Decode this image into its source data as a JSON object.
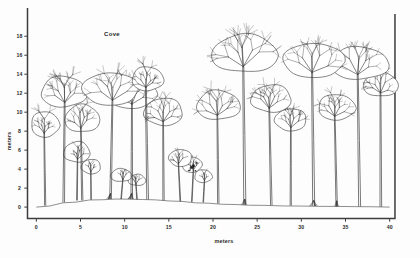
{
  "chart_data": {
    "type": "diagram-profile",
    "title": "Cove",
    "xlabel": "meters",
    "ylabel": "meters",
    "xlim": [
      -1,
      41
    ],
    "ylim": [
      -1.2,
      19.5
    ],
    "xticks": [
      0,
      5,
      10,
      15,
      20,
      25,
      30,
      35,
      40
    ],
    "xtick_labels": [
      "0",
      "5",
      "10",
      "15",
      "20",
      "25",
      "30",
      "35",
      "40"
    ],
    "yticks": [
      0,
      2,
      4,
      6,
      8,
      10,
      12,
      14,
      16,
      18
    ],
    "ytick_labels": [
      "0",
      "2",
      "4",
      "6",
      "8",
      "10",
      "12",
      "14",
      "16",
      "18"
    ],
    "grid": false,
    "legend": false,
    "frame_sides": [
      "left",
      "bottom",
      "right"
    ],
    "line_color": "#3a3a3a",
    "ground_color": "#6a6a6a",
    "ground_profile": [
      [
        0,
        0.0
      ],
      [
        3,
        0.45
      ],
      [
        6,
        0.75
      ],
      [
        9,
        0.85
      ],
      [
        12,
        0.8
      ],
      [
        15,
        0.65
      ],
      [
        18,
        0.45
      ],
      [
        21,
        0.3
      ],
      [
        24,
        0.2
      ],
      [
        28,
        0.12
      ],
      [
        32,
        0.08
      ],
      [
        36,
        0.05
      ],
      [
        40,
        0.0
      ]
    ],
    "trees": [
      {
        "id": 1,
        "x": 1.0,
        "base": 0.15,
        "height": 10.2,
        "crown_w": 3.2,
        "crown_h": 3.0,
        "crown_y": 8.6,
        "dark": false,
        "buttress": false
      },
      {
        "id": 2,
        "x": 3.1,
        "base": 0.5,
        "height": 14.0,
        "crown_w": 5.2,
        "crown_h": 3.6,
        "crown_y": 12.0,
        "dark": false,
        "buttress": false
      },
      {
        "id": 3,
        "x": 5.2,
        "base": 0.7,
        "height": 11.0,
        "crown_w": 4.0,
        "crown_h": 3.2,
        "crown_y": 9.2,
        "dark": false,
        "buttress": false
      },
      {
        "id": 4,
        "x": 4.6,
        "base": 0.7,
        "height": 7.0,
        "crown_w": 3.0,
        "crown_h": 2.4,
        "crown_y": 5.7,
        "dark": false,
        "buttress": false
      },
      {
        "id": 5,
        "x": 6.2,
        "base": 0.78,
        "height": 5.1,
        "crown_w": 2.2,
        "crown_h": 1.7,
        "crown_y": 4.2,
        "dark": false,
        "buttress": false
      },
      {
        "id": 6,
        "x": 8.4,
        "base": 0.85,
        "height": 14.2,
        "crown_w": 6.4,
        "crown_h": 3.8,
        "crown_y": 12.3,
        "dark": false,
        "buttress": true
      },
      {
        "id": 7,
        "x": 10.8,
        "base": 0.85,
        "height": 13.6,
        "crown_w": 5.6,
        "crown_h": 3.4,
        "crown_y": 11.8,
        "dark": false,
        "buttress": true
      },
      {
        "id": 8,
        "x": 12.6,
        "base": 0.8,
        "height": 15.0,
        "crown_w": 3.6,
        "crown_h": 2.8,
        "crown_y": 13.4,
        "dark": false,
        "buttress": false
      },
      {
        "id": 9,
        "x": 9.6,
        "base": 0.85,
        "height": 4.0,
        "crown_w": 2.4,
        "crown_h": 1.5,
        "crown_y": 3.3,
        "dark": false,
        "buttress": false
      },
      {
        "id": 10,
        "x": 11.4,
        "base": 0.82,
        "height": 3.4,
        "crown_w": 2.0,
        "crown_h": 1.3,
        "crown_y": 2.8,
        "dark": false,
        "buttress": false
      },
      {
        "id": 11,
        "x": 14.4,
        "base": 0.7,
        "height": 11.6,
        "crown_w": 4.4,
        "crown_h": 3.2,
        "crown_y": 9.9,
        "dark": false,
        "buttress": false
      },
      {
        "id": 12,
        "x": 16.3,
        "base": 0.6,
        "height": 6.2,
        "crown_w": 2.6,
        "crown_h": 2.0,
        "crown_y": 5.1,
        "dark": false,
        "buttress": false
      },
      {
        "id": 13,
        "x": 17.6,
        "base": 0.55,
        "height": 5.4,
        "crown_w": 2.3,
        "crown_h": 1.8,
        "crown_y": 4.4,
        "dark": true,
        "buttress": false
      },
      {
        "id": 14,
        "x": 18.9,
        "base": 0.5,
        "height": 4.0,
        "crown_w": 2.0,
        "crown_h": 1.5,
        "crown_y": 3.2,
        "dark": false,
        "buttress": false
      },
      {
        "id": 15,
        "x": 20.6,
        "base": 0.38,
        "height": 12.4,
        "crown_w": 5.0,
        "crown_h": 3.4,
        "crown_y": 10.6,
        "dark": false,
        "buttress": false
      },
      {
        "id": 16,
        "x": 23.6,
        "base": 0.25,
        "height": 18.3,
        "crown_w": 7.6,
        "crown_h": 4.4,
        "crown_y": 16.0,
        "dark": false,
        "buttress": true
      },
      {
        "id": 17,
        "x": 26.6,
        "base": 0.2,
        "height": 13.0,
        "crown_w": 4.6,
        "crown_h": 3.2,
        "crown_y": 11.3,
        "dark": false,
        "buttress": false
      },
      {
        "id": 18,
        "x": 28.8,
        "base": 0.16,
        "height": 10.4,
        "crown_w": 3.6,
        "crown_h": 2.6,
        "crown_y": 9.1,
        "dark": false,
        "buttress": false
      },
      {
        "id": 19,
        "x": 31.4,
        "base": 0.12,
        "height": 17.4,
        "crown_w": 7.0,
        "crown_h": 4.0,
        "crown_y": 15.3,
        "dark": false,
        "buttress": true
      },
      {
        "id": 20,
        "x": 34.0,
        "base": 0.08,
        "height": 12.0,
        "crown_w": 4.2,
        "crown_h": 3.0,
        "crown_y": 10.4,
        "dark": false,
        "buttress": true
      },
      {
        "id": 21,
        "x": 36.6,
        "base": 0.06,
        "height": 17.0,
        "crown_w": 6.6,
        "crown_h": 3.8,
        "crown_y": 15.0,
        "dark": false,
        "buttress": false
      },
      {
        "id": 22,
        "x": 39.0,
        "base": 0.03,
        "height": 14.4,
        "crown_w": 4.0,
        "crown_h": 2.8,
        "crown_y": 12.8,
        "dark": false,
        "buttress": false
      }
    ]
  }
}
